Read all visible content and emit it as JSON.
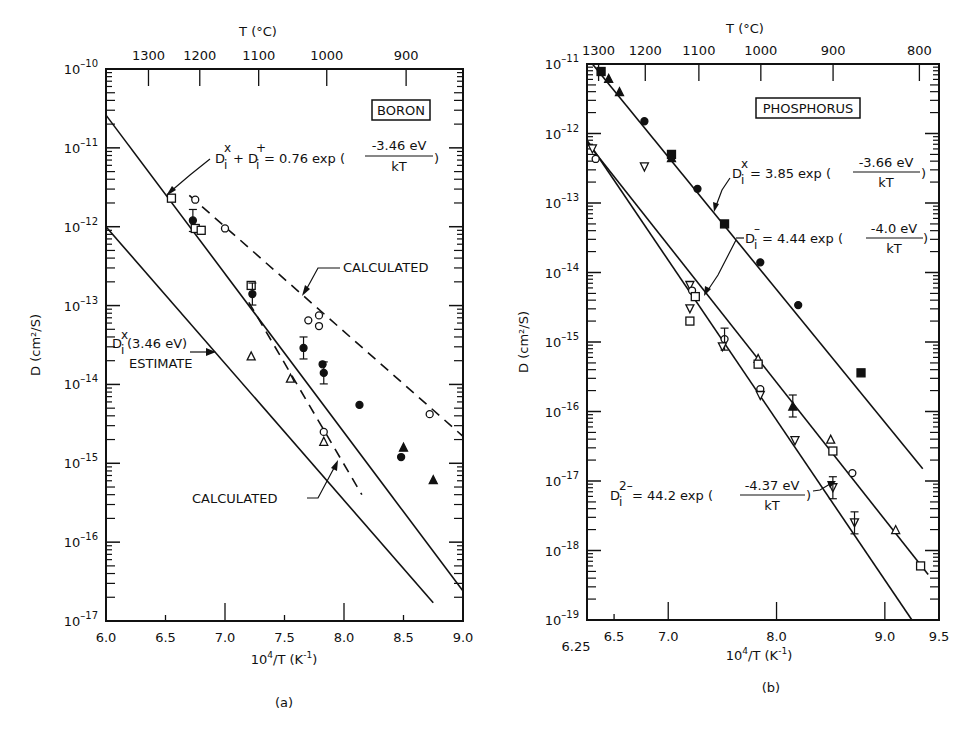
{
  "chart_data": [
    {
      "panel": "a",
      "type": "scatter",
      "caption": "(a)",
      "title": "BORON",
      "xlabel": "10^4/T (K^-1)",
      "ylabel": "D (cm^2/S)",
      "top_axis_label": "T (°C)",
      "top_ticks": [
        {
          "label": "1300",
          "x": 6.357
        },
        {
          "label": "1200",
          "x": 6.788
        },
        {
          "label": "1100",
          "x": 7.283
        },
        {
          "label": "1000",
          "x": 7.855
        },
        {
          "label": "900",
          "x": 8.522
        }
      ],
      "xlim": [
        6.0,
        9.0
      ],
      "xticks": [
        6.0,
        6.5,
        7.0,
        7.5,
        8.0,
        8.5,
        9.0
      ],
      "xtick_labels": [
        "6.0",
        "6.5",
        "7.0",
        "7.5",
        "8.0",
        "8.5",
        "9.0"
      ],
      "ylim_exp": [
        -17,
        -10
      ],
      "ytick_labels": [
        "10-10",
        "10-11",
        "10-12",
        "10-13",
        "10-14",
        "10-15",
        "10-16",
        "10-17"
      ],
      "lines": [
        {
          "name": "Di^x + Di^+ fit",
          "style": "solid",
          "points": [
            [
              6.0,
              2.6e-11
            ],
            [
              9.0,
              2.4e-17
            ]
          ]
        },
        {
          "name": "Calculated (upper)",
          "style": "dashed",
          "points": [
            [
              6.7,
              2.5e-12
            ],
            [
              9.0,
              2.2e-15
            ]
          ]
        },
        {
          "name": "Di^x (3.46 eV) estimate",
          "style": "solid",
          "points": [
            [
              6.0,
              1e-12
            ],
            [
              8.75,
              1.7e-17
            ]
          ]
        },
        {
          "name": "Calculated (lower)",
          "style": "dashed",
          "points": [
            [
              7.2,
              1.1e-13
            ],
            [
              8.15,
              4e-16
            ]
          ]
        }
      ],
      "points": [
        {
          "marker": "square-open",
          "x": 6.55,
          "y": 2.3e-12
        },
        {
          "marker": "circle-filled-errbar",
          "x": 6.73,
          "y": 1.2e-12
        },
        {
          "marker": "square-open",
          "x": 6.75,
          "y": 9.5e-13
        },
        {
          "marker": "square-open",
          "x": 6.8,
          "y": 9e-13
        },
        {
          "marker": "circle-open",
          "x": 6.75,
          "y": 2.2e-12
        },
        {
          "marker": "circle-open",
          "x": 7.0,
          "y": 9.5e-13
        },
        {
          "marker": "square-open",
          "x": 7.22,
          "y": 1.8e-13
        },
        {
          "marker": "circle-filled-errbar",
          "x": 7.23,
          "y": 1.4e-13
        },
        {
          "marker": "circle-open",
          "x": 7.7,
          "y": 6.5e-14
        },
        {
          "marker": "circle-open",
          "x": 7.79,
          "y": 7.5e-14
        },
        {
          "marker": "circle-open",
          "x": 7.79,
          "y": 5.5e-14
        },
        {
          "marker": "circle-filled-errbar",
          "x": 7.66,
          "y": 2.9e-14
        },
        {
          "marker": "circle-filled",
          "x": 7.82,
          "y": 1.8e-14
        },
        {
          "marker": "circle-filled-errbar",
          "x": 7.83,
          "y": 1.4e-14
        },
        {
          "marker": "circle-filled",
          "x": 8.13,
          "y": 5.5e-15
        },
        {
          "marker": "triangle-filled",
          "x": 8.5,
          "y": 1.6e-15
        },
        {
          "marker": "circle-filled",
          "x": 8.48,
          "y": 1.2e-15
        },
        {
          "marker": "triangle-filled",
          "x": 8.75,
          "y": 6.2e-16
        },
        {
          "marker": "circle-open",
          "x": 8.72,
          "y": 4.2e-15
        },
        {
          "marker": "triangle-open",
          "x": 7.22,
          "y": 2.3e-14
        },
        {
          "marker": "triangle-open",
          "x": 7.55,
          "y": 1.2e-14
        },
        {
          "marker": "circle-open",
          "x": 7.83,
          "y": 2.5e-15
        },
        {
          "marker": "triangle-open",
          "x": 7.83,
          "y": 1.9e-15
        }
      ],
      "annotations": [
        {
          "text": "Di^x + Di^+ = 0.76 exp(-3.46 eV / kT)"
        },
        {
          "text": "CALCULATED"
        },
        {
          "text": "Di^x (3.46 eV) ESTIMATE"
        },
        {
          "text": "CALCULATED"
        }
      ]
    },
    {
      "panel": "b",
      "type": "scatter",
      "caption": "(b)",
      "title": "PHOSPHORUS",
      "xlabel": "10^4/T (K^-1)",
      "ylabel": "D (cm^2/S)",
      "top_axis_label": "T (°C)",
      "top_ticks": [
        {
          "label": "1300",
          "x": 6.357
        },
        {
          "label": "1200",
          "x": 6.788
        },
        {
          "label": "1100",
          "x": 7.283
        },
        {
          "label": "1000",
          "x": 7.855
        },
        {
          "label": "900",
          "x": 8.522
        },
        {
          "label": "800",
          "x": 9.319
        }
      ],
      "xlim": [
        6.25,
        9.5
      ],
      "xticks": [
        6.5,
        7.0,
        8.0,
        9.0,
        9.5
      ],
      "xtick_labels": [
        "6.5",
        "7.0",
        "8.0",
        "9.0",
        "9.5"
      ],
      "extra_xlabel": "6.25",
      "ylim_exp": [
        -19,
        -11
      ],
      "ytick_labels": [
        "10-11",
        "10-12",
        "10-13",
        "10-14",
        "10-15",
        "10-16",
        "10-17",
        "10-18",
        "10-19"
      ],
      "lines": [
        {
          "name": "Di^x = 3.85 exp(-3.66 eV/kT)",
          "style": "solid",
          "points": [
            [
              6.3,
              1e-11
            ],
            [
              9.35,
              1.5e-17
            ]
          ]
        },
        {
          "name": "Di^- = 4.44 exp(-4.0 eV/kT)",
          "style": "solid",
          "points": [
            [
              6.25,
              7.5e-13
            ],
            [
              9.4,
              4.5e-19
            ]
          ]
        },
        {
          "name": "Di^2- = 44.2 exp(-4.37 eV/kT)",
          "style": "solid",
          "points": [
            [
              6.25,
              8e-13
            ],
            [
              9.25,
              1e-19
            ]
          ]
        }
      ],
      "points": [
        {
          "marker": "square-filled",
          "x": 6.38,
          "y": 7.8e-12
        },
        {
          "marker": "triangle-filled",
          "x": 6.45,
          "y": 6.2e-12
        },
        {
          "marker": "triangle-filled",
          "x": 6.55,
          "y": 4e-12
        },
        {
          "marker": "circle-filled",
          "x": 6.78,
          "y": 1.5e-12
        },
        {
          "marker": "square-filled",
          "x": 7.03,
          "y": 5e-13
        },
        {
          "marker": "triangle-filled",
          "x": 7.03,
          "y": 4.5e-13
        },
        {
          "marker": "circle-filled",
          "x": 7.27,
          "y": 1.6e-13
        },
        {
          "marker": "square-filled",
          "x": 7.52,
          "y": 5e-14
        },
        {
          "marker": "circle-filled",
          "x": 7.85,
          "y": 1.4e-14
        },
        {
          "marker": "circle-filled",
          "x": 8.2,
          "y": 3.4e-15
        },
        {
          "marker": "square-filled",
          "x": 8.78,
          "y": 3.6e-16
        },
        {
          "marker": "triangle-down-open",
          "x": 6.3,
          "y": 6e-13
        },
        {
          "marker": "circle-open",
          "x": 6.33,
          "y": 4.3e-13
        },
        {
          "marker": "triangle-down-open",
          "x": 6.78,
          "y": 3.3e-13
        },
        {
          "marker": "triangle-down-open",
          "x": 7.2,
          "y": 6.5e-15
        },
        {
          "marker": "circle-open",
          "x": 7.22,
          "y": 5.5e-15
        },
        {
          "marker": "square-open",
          "x": 7.25,
          "y": 4.5e-15
        },
        {
          "marker": "triangle-down-open",
          "x": 7.2,
          "y": 3e-15
        },
        {
          "marker": "square-open",
          "x": 7.2,
          "y": 2e-15
        },
        {
          "marker": "circle-errbar",
          "x": 7.52,
          "y": 1.1e-15
        },
        {
          "marker": "triangle-down-open",
          "x": 7.5,
          "y": 8.5e-16
        },
        {
          "marker": "triangle-open",
          "x": 7.83,
          "y": 5.8e-16
        },
        {
          "marker": "square-open",
          "x": 7.83,
          "y": 4.8e-16
        },
        {
          "marker": "circle-open",
          "x": 7.85,
          "y": 2.1e-16
        },
        {
          "marker": "triangle-down-open",
          "x": 7.85,
          "y": 1.7e-16
        },
        {
          "marker": "triangle-filled-errbar",
          "x": 8.15,
          "y": 1.2e-16
        },
        {
          "marker": "triangle-down-open",
          "x": 8.17,
          "y": 3.8e-17
        },
        {
          "marker": "triangle-open",
          "x": 8.5,
          "y": 4e-17
        },
        {
          "marker": "square-open",
          "x": 8.52,
          "y": 2.7e-17
        },
        {
          "marker": "triangle-down-open-errbar",
          "x": 8.52,
          "y": 8e-18
        },
        {
          "marker": "circle-open",
          "x": 8.7,
          "y": 1.3e-17
        },
        {
          "marker": "triangle-down-open-errbar",
          "x": 8.72,
          "y": 2.5e-18
        },
        {
          "marker": "triangle-open",
          "x": 9.1,
          "y": 2e-18
        },
        {
          "marker": "square-open",
          "x": 9.33,
          "y": 6e-19
        }
      ],
      "annotations": [
        {
          "text": "Di^x = 3.85 exp(-3.66 eV / kT)"
        },
        {
          "text": "Di^- = 4.44 exp(-4.0 eV / kT)"
        },
        {
          "text": "Di^2- = 44.2 exp(-4.37 eV / kT)"
        }
      ]
    }
  ],
  "labels": {
    "a": {
      "top_axis": "T (°C)",
      "title_box": "BORON",
      "ylabel": "D (cm²/S)",
      "xlabel_main": "10",
      "xlabel_sup": "4",
      "xlabel_rest": "/T (K",
      "xlabel_sup2": "-1",
      "xlabel_end": ")",
      "caption": "(a)",
      "eq1_lhs": "D",
      "eq1_mid": "+ D",
      "eq1_coef": "= 0.76  exp (",
      "eq1_num": "-3.46 eV",
      "eq1_den": "kT",
      "eq1_close": ")",
      "calc_upper": "CALCULATED",
      "estimate_l1": "(3.46 eV)",
      "estimate_l2": "ESTIMATE",
      "calc_lower": "CALCULATED"
    },
    "b": {
      "top_axis": "T (°C)",
      "title_box": "PHOSPHORUS",
      "ylabel": "D (cm²/S)",
      "caption": "(b)",
      "extra_x": "6.25",
      "eq1_coef": "= 3.85 exp (",
      "eq1_num": "-3.66 eV",
      "eq1_den": "kT",
      "eq2_coef": "= 4.44 exp (",
      "eq2_num": "-4.0 eV",
      "eq2_den": "kT",
      "eq3_coef": "= 44.2 exp (",
      "eq3_num": "-4.37 eV",
      "eq3_den": "kT",
      "close": ")"
    }
  }
}
